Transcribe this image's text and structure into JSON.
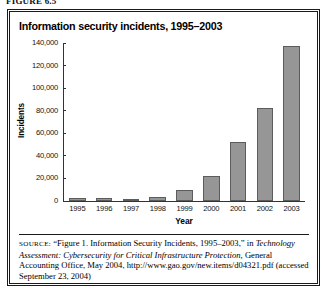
{
  "running_head": "FIGURE 6.5",
  "figure": {
    "title": "Information security incidents, 1995–2003",
    "source_prefix": "SOURCE:",
    "source_quote": "“Figure 1. Information Security Incidents, 1995–2003,” in",
    "source_italic": "Technology Assessment: Cybersecurity for Critical Infrastructure Protection,",
    "source_rest": " General Accounting Office, May 2004, http://www.gao.gov/new.items/d04321.pdf (accessed September 23, 2004)"
  },
  "chart_data": {
    "type": "bar",
    "title": "Information security incidents, 1995–2003",
    "xlabel": "Year",
    "ylabel": "Incidents",
    "categories": [
      "1995",
      "1996",
      "1997",
      "1998",
      "1999",
      "2000",
      "2001",
      "2002",
      "2003"
    ],
    "values": [
      2412,
      2573,
      2134,
      3734,
      9859,
      21756,
      52658,
      82094,
      137529
    ],
    "ylim": [
      0,
      140000
    ],
    "yticks": [
      0,
      20000,
      40000,
      60000,
      80000,
      100000,
      120000,
      140000
    ],
    "ytick_labels": [
      "0",
      "20,000",
      "40,000",
      "60,000",
      "80,000",
      "100,000",
      "120,000",
      "140,000"
    ],
    "grid": false,
    "legend": false,
    "bar_color": "#969696",
    "bar_edge_color": "#5c5c5c"
  }
}
